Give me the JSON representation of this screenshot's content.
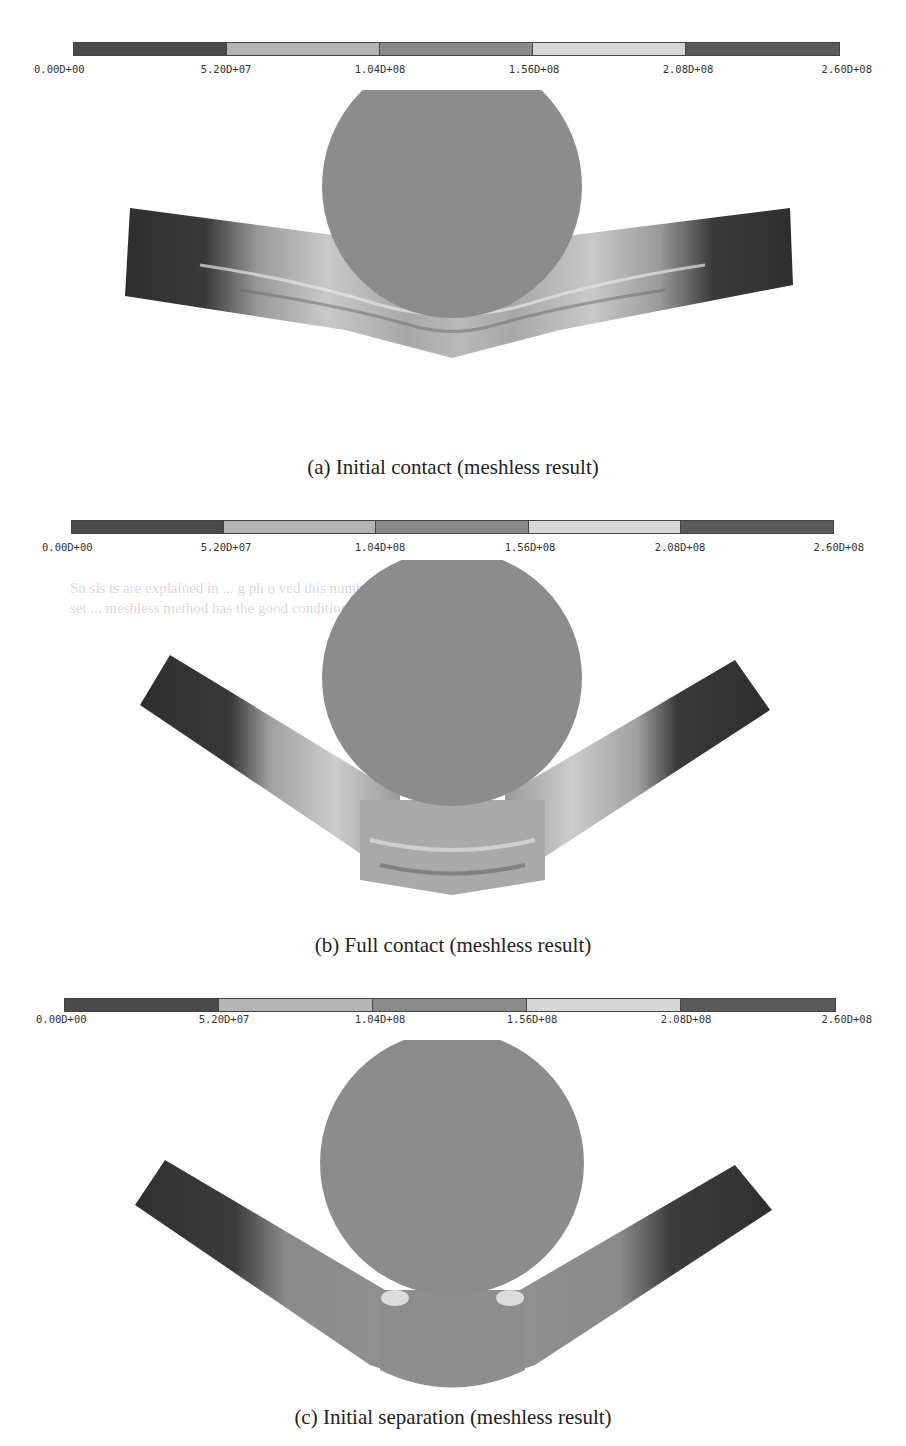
{
  "figure": {
    "colorbar": {
      "segment_colors": [
        "#4a4a4a",
        "#b4b4b4",
        "#8a8a8a",
        "#d6d6d6",
        "#5a5a5a"
      ],
      "tick_labels": [
        "0.00D+00",
        "5.20D+07",
        "1.04D+08",
        "1.56D+08",
        "2.08D+08",
        "2.60D+08"
      ]
    },
    "panels": [
      {
        "id": "a",
        "caption": "(a) Initial contact (meshless result)"
      },
      {
        "id": "b",
        "caption": "(b) Full contact (meshless result)"
      },
      {
        "id": "c",
        "caption": "(c) Initial separation (meshless result)"
      }
    ],
    "colors": {
      "cylinder": "#8c8c8c",
      "plate_dark": "#3a3a3a",
      "plate_light": "#d0d0d0"
    }
  },
  "bleed_through_text": {
    "line1": "Sn  sis  ts are explained in ...  g  ph   o  ved this number is",
    "line2": "set  ...    meshless method has the good  condition and"
  }
}
